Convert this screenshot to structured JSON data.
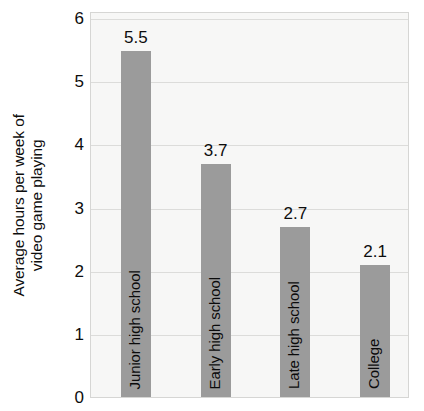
{
  "chart_data": {
    "type": "bar",
    "title": "",
    "subtitle": "",
    "xlabel": "",
    "ylabel": "Average hours per week of video game playing",
    "ylabel_lines": [
      "Average hours per week of",
      "video game playing"
    ],
    "categories": [
      "Junior high school",
      "Early high school",
      "Late high school",
      "College"
    ],
    "values": [
      5.5,
      3.7,
      2.7,
      2.1
    ],
    "value_labels": [
      "5.5",
      "3.7",
      "2.7",
      "2.1"
    ],
    "ylim": [
      0,
      6
    ],
    "ytick_labels": [
      "0",
      "1",
      "2",
      "3",
      "4",
      "5",
      "6"
    ],
    "ytick_values": [
      0,
      1,
      2,
      3,
      4,
      5,
      6
    ],
    "grid": true,
    "legend": "none",
    "colors": {
      "bar_fill": "#9b9b9b",
      "plot_background": "#f7f7f6",
      "plot_border": "#d6d6d4",
      "gridline": "#dcdcda",
      "text": "#0d0d0d",
      "page_background": "#ffffff"
    }
  }
}
